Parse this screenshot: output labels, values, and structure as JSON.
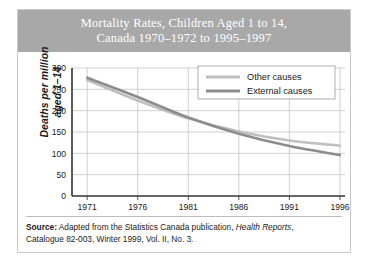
{
  "figure": {
    "title_line1": "Mortality Rates, Children Aged 1 to 14,",
    "title_line2": "Canada 1970–1972 to 1995–1997",
    "banner_color": "#a8a8a8",
    "frame_color": "#c9c9c9"
  },
  "axis_title": {
    "line1": "Deaths per million",
    "line2": "aged 1–14"
  },
  "source": {
    "label": "Source:",
    "text_part1": " Adapted from the Statistics Canada publication, ",
    "italic_part": "Health Reports",
    "text_part2": ",",
    "line2": "Catalogue 82-003, Winter 1999, Vol. II, No. 3."
  },
  "chart_data": {
    "type": "line",
    "title": "Mortality Rates, Children Aged 1 to 14, Canada 1970–1972 to 1995–1997",
    "xlabel": "",
    "ylabel": "Deaths per million aged 1–14",
    "xlim": [
      1969.5,
      1996.5
    ],
    "ylim": [
      0,
      300
    ],
    "yticks": [
      0,
      50,
      100,
      150,
      200,
      250,
      300
    ],
    "xticks": [
      1971,
      1976,
      1981,
      1986,
      1991,
      1996
    ],
    "grid": true,
    "legend_position": "top-right",
    "x": [
      1971,
      1976,
      1981,
      1986,
      1991,
      1996
    ],
    "series": [
      {
        "name": "Other causes",
        "color": "#bfbfbf",
        "values": [
          272,
          224,
          182,
          151,
          130,
          118
        ]
      },
      {
        "name": "External causes",
        "color": "#8c8c8c",
        "values": [
          277,
          232,
          184,
          146,
          117,
          96
        ]
      }
    ]
  }
}
